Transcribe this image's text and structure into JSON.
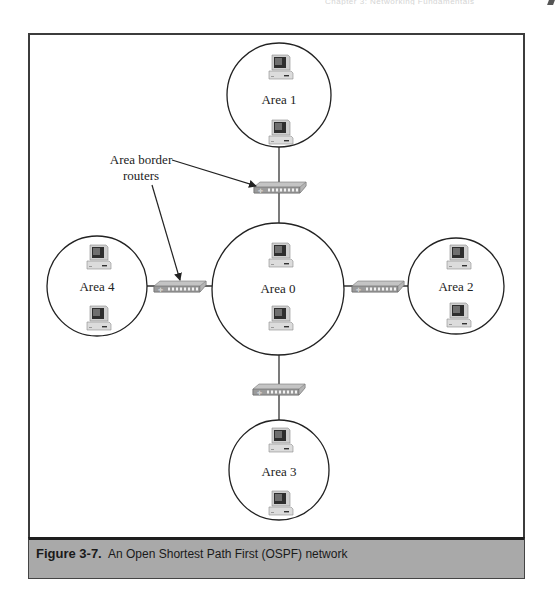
{
  "page": {
    "running_head": "Chapter 3: Networking Fundamentals"
  },
  "diagram": {
    "areas": [
      {
        "id": "area-0",
        "label": "Area 0",
        "role": "backbone",
        "cx": 278,
        "cy": 289,
        "r": 66,
        "computers": 2
      },
      {
        "id": "area-1",
        "label": "Area 1",
        "role": "non-backbone",
        "cx": 279,
        "cy": 95,
        "r": 52,
        "computers": 2
      },
      {
        "id": "area-2",
        "label": "Area 2",
        "role": "non-backbone",
        "cx": 456,
        "cy": 286,
        "r": 48,
        "computers": 2
      },
      {
        "id": "area-3",
        "label": "Area 3",
        "role": "non-backbone",
        "cx": 279,
        "cy": 470,
        "r": 50,
        "computers": 2
      },
      {
        "id": "area-4",
        "label": "Area 4",
        "role": "non-backbone",
        "cx": 97,
        "cy": 286,
        "r": 50,
        "computers": 2
      }
    ],
    "routers": [
      {
        "id": "router-1-0",
        "connects": [
          "Area 1",
          "Area 0"
        ],
        "x": 278,
        "y": 186
      },
      {
        "id": "router-4-0",
        "connects": [
          "Area 4",
          "Area 0"
        ],
        "x": 180,
        "y": 286
      },
      {
        "id": "router-0-2",
        "connects": [
          "Area 0",
          "Area 2"
        ],
        "x": 378,
        "y": 286
      },
      {
        "id": "router-0-3",
        "connects": [
          "Area 0",
          "Area 3"
        ],
        "x": 278,
        "y": 389
      }
    ],
    "callout": {
      "line1": "Area border",
      "line2": "routers",
      "points_to": [
        "router-1-0",
        "router-4-0"
      ]
    }
  },
  "caption": {
    "label": "Figure 3-7.",
    "text": "An Open Shortest Path First (OSPF) network"
  },
  "colors": {
    "frame": "#3c3c3c",
    "caption_bg": "#a9a9a9",
    "line": "#333333"
  }
}
